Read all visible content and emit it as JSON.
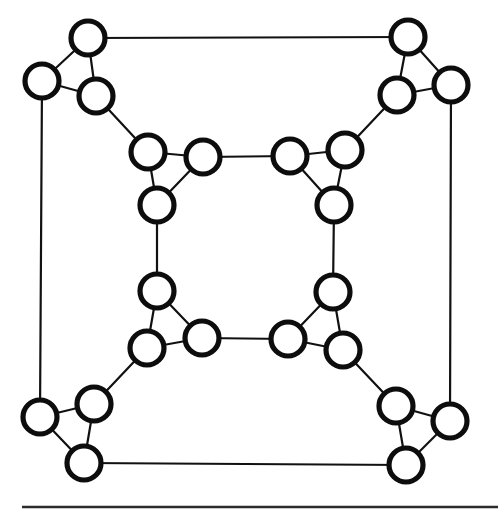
{
  "figure": {
    "title": "",
    "background_color": "#ffffff",
    "width": 498,
    "height": 511
  },
  "style": {
    "node_fill": "#ffffff",
    "node_stroke": "#0d0d0d",
    "node_radius": 17,
    "node_stroke_width": 5.2,
    "edge_color": "#111111",
    "edge_width": 2.2,
    "rule_color": "#2b2b2b",
    "rule_width": 2.4
  },
  "graph": {
    "type": "node-link-diagram",
    "node_count": 24,
    "edge_count": 36,
    "description": "symmetric graph drawing: eight triangle clusters arranged at the corners of an outer square and an inner square, joined by straight connector lines",
    "nodes": [
      {
        "id": "n1",
        "x": 88,
        "y": 38,
        "cluster": "outer-top-left"
      },
      {
        "id": "n2",
        "x": 42,
        "y": 81,
        "cluster": "outer-top-left"
      },
      {
        "id": "n3",
        "x": 96,
        "y": 96,
        "cluster": "outer-top-left"
      },
      {
        "id": "n4",
        "x": 408,
        "y": 37,
        "cluster": "outer-top-right"
      },
      {
        "id": "n5",
        "x": 451,
        "y": 85,
        "cluster": "outer-top-right"
      },
      {
        "id": "n6",
        "x": 397,
        "y": 95,
        "cluster": "outer-top-right"
      },
      {
        "id": "n7",
        "x": 40,
        "y": 417,
        "cluster": "outer-bottom-left"
      },
      {
        "id": "n8",
        "x": 94,
        "y": 404,
        "cluster": "outer-bottom-left"
      },
      {
        "id": "n9",
        "x": 84,
        "y": 463,
        "cluster": "outer-bottom-left"
      },
      {
        "id": "n10",
        "x": 396,
        "y": 406,
        "cluster": "outer-bottom-right"
      },
      {
        "id": "n11",
        "x": 450,
        "y": 421,
        "cluster": "outer-bottom-right"
      },
      {
        "id": "n12",
        "x": 406,
        "y": 465,
        "cluster": "outer-bottom-right"
      },
      {
        "id": "n13",
        "x": 148,
        "y": 152,
        "cluster": "inner-top-left"
      },
      {
        "id": "n14",
        "x": 203,
        "y": 157,
        "cluster": "inner-top-left"
      },
      {
        "id": "n15",
        "x": 157,
        "y": 205,
        "cluster": "inner-top-left"
      },
      {
        "id": "n16",
        "x": 290,
        "y": 156,
        "cluster": "inner-top-right"
      },
      {
        "id": "n17",
        "x": 345,
        "y": 150,
        "cluster": "inner-top-right"
      },
      {
        "id": "n18",
        "x": 334,
        "y": 205,
        "cluster": "inner-top-right"
      },
      {
        "id": "n19",
        "x": 157,
        "y": 291,
        "cluster": "inner-bottom-left"
      },
      {
        "id": "n20",
        "x": 147,
        "y": 348,
        "cluster": "inner-bottom-left"
      },
      {
        "id": "n21",
        "x": 202,
        "y": 338,
        "cluster": "inner-bottom-left"
      },
      {
        "id": "n22",
        "x": 333,
        "y": 292,
        "cluster": "inner-bottom-right"
      },
      {
        "id": "n23",
        "x": 288,
        "y": 339,
        "cluster": "inner-bottom-right"
      },
      {
        "id": "n24",
        "x": 343,
        "y": 350,
        "cluster": "inner-bottom-right"
      }
    ],
    "edges": [
      [
        "n1",
        "n2"
      ],
      [
        "n2",
        "n3"
      ],
      [
        "n3",
        "n1"
      ],
      [
        "n4",
        "n5"
      ],
      [
        "n5",
        "n6"
      ],
      [
        "n6",
        "n4"
      ],
      [
        "n7",
        "n8"
      ],
      [
        "n8",
        "n9"
      ],
      [
        "n9",
        "n7"
      ],
      [
        "n10",
        "n11"
      ],
      [
        "n11",
        "n12"
      ],
      [
        "n12",
        "n10"
      ],
      [
        "n13",
        "n14"
      ],
      [
        "n14",
        "n15"
      ],
      [
        "n15",
        "n13"
      ],
      [
        "n16",
        "n17"
      ],
      [
        "n17",
        "n18"
      ],
      [
        "n18",
        "n16"
      ],
      [
        "n19",
        "n20"
      ],
      [
        "n20",
        "n21"
      ],
      [
        "n21",
        "n19"
      ],
      [
        "n22",
        "n23"
      ],
      [
        "n23",
        "n24"
      ],
      [
        "n24",
        "n22"
      ],
      [
        "n1",
        "n4"
      ],
      [
        "n2",
        "n7"
      ],
      [
        "n5",
        "n11"
      ],
      [
        "n9",
        "n12"
      ],
      [
        "n3",
        "n13"
      ],
      [
        "n6",
        "n17"
      ],
      [
        "n8",
        "n20"
      ],
      [
        "n10",
        "n24"
      ],
      [
        "n14",
        "n16"
      ],
      [
        "n15",
        "n19"
      ],
      [
        "n18",
        "n22"
      ],
      [
        "n21",
        "n23"
      ]
    ]
  },
  "page_rule": {
    "name": "horizontal-rule",
    "x1": 22,
    "x2": 498,
    "y": 507
  }
}
